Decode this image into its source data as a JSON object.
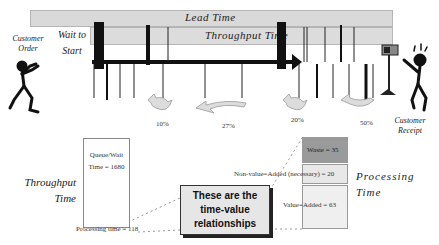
{
  "timeline": {
    "lead_time_label": "Lead Time",
    "throughput_time_label": "Throughput Time",
    "wait_to_start_label": "Wait to Start",
    "customer_order_label": "Customer Order",
    "customer_receipt_label": "Customer Receipt",
    "percentages": [
      "10%",
      "27%",
      "20%",
      "50%"
    ]
  },
  "breakdown": {
    "throughput_time_label": "Throughput Time",
    "queue_wait_label": "Queue/Wait Time = 1680",
    "processing_time_small_label": "Processing time = 118",
    "processing_time_label": "Processing Time",
    "waste_label": "Waste = 35",
    "non_value_added_label": "Non-value=Added (necessary) = 20",
    "value_added_label": "Value=Added = 63",
    "callout_text": "These are the time-value relationships"
  },
  "colors": {
    "bar_fill": "#d9d9d9",
    "waste_fill": "#9a9a9a",
    "nva_fill": "#e8e8e8",
    "va_fill": "#efefef",
    "line": "#111111",
    "arrow_fill": "#dcdcdc"
  }
}
